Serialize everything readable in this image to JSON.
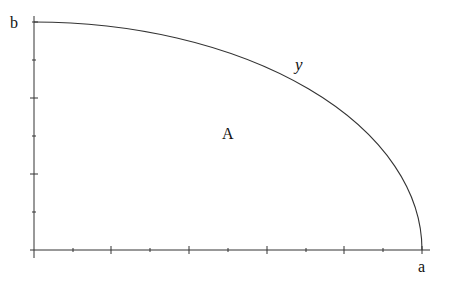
{
  "diagram": {
    "title": "",
    "labels": {
      "y_axis_top": "b",
      "x_axis_end": "a",
      "curve": "y",
      "region": "A"
    },
    "axes": {
      "origin_px": [
        34,
        250
      ],
      "x_end_px": 430,
      "y_top_px": 16,
      "x_ticks": 11,
      "y_ticks": 7
    },
    "curve": {
      "type": "quarter-ellipse",
      "start": "(0, b)",
      "end": "(a, 0)"
    },
    "colors": {
      "line": "#333333",
      "text": "#111111",
      "background": "#ffffff"
    }
  }
}
